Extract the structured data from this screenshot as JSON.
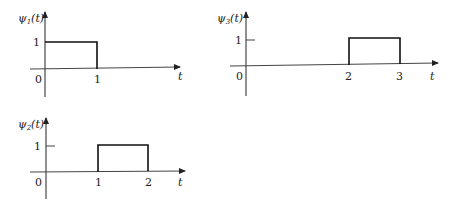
{
  "plots": [
    {
      "id": "psi1",
      "ylabel_base": "ψ",
      "ylabel_sub": "1",
      "ylabel_arg": "(t)",
      "xlabel": "t",
      "origin_label": "0",
      "level_label": "1",
      "pulse_start": "0",
      "pulse_end": "1",
      "tick_labels": [
        "0",
        "1"
      ]
    },
    {
      "id": "psi2",
      "ylabel_base": "ψ",
      "ylabel_sub": "2",
      "ylabel_arg": "(t)",
      "xlabel": "t",
      "origin_label": "0",
      "level_label": "1",
      "pulse_start": "1",
      "pulse_end": "2",
      "tick_labels": [
        "0",
        "1",
        "2"
      ]
    },
    {
      "id": "psi3",
      "ylabel_base": "ψ",
      "ylabel_sub": "3",
      "ylabel_arg": "(t)",
      "xlabel": "t",
      "origin_label": "0",
      "level_label": "1",
      "pulse_start": "2",
      "pulse_end": "3",
      "tick_labels": [
        "0",
        "2",
        "3"
      ]
    }
  ]
}
